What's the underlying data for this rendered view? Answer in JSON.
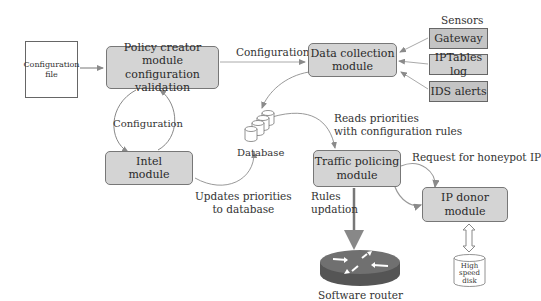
{
  "diagram": {
    "nodes": {
      "config_file": "Configuration file",
      "config_file_line1": "Configuration",
      "config_file_line2": "file",
      "policy_creator_line1": "Policy creator module",
      "policy_creator_line2": "configuration validation",
      "data_collection_line1": "Data collection",
      "data_collection_line2": "module",
      "sensors_title": "Sensors",
      "sensors": [
        "Gateway",
        "IPTables log",
        "IDS alerts"
      ],
      "intel_line1": "Intel",
      "intel_line2": "module",
      "database": "Database",
      "traffic_policing_line1": "Traffic policing",
      "traffic_policing_line2": "module",
      "ip_donor_line1": "IP donor",
      "ip_donor_line2": "module",
      "disk_line1": "High",
      "disk_line2": "speed",
      "disk_line3": "disk",
      "router": "Software router"
    },
    "edge_labels": {
      "policy_to_data": "Configuration",
      "policy_intel_loop": "Configuration",
      "reads_line1": "Reads priorities",
      "reads_line2": "with configuration rules",
      "updates_line1": "Updates priorities",
      "updates_line2": "to database",
      "honeypot": "Request for honeypot IP",
      "rules_line1": "Rules",
      "rules_line2": "updation"
    },
    "colors": {
      "module_fill": "#d4d4d4",
      "sensor_fill": "#c4c4c4",
      "edge": "#9a9a9a",
      "router_top": "#6e6e6e",
      "router_side": "#555555"
    }
  }
}
